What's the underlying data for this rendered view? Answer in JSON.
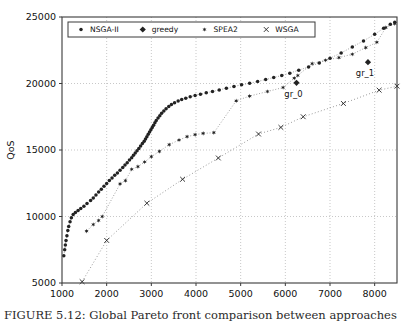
{
  "figure": {
    "caption": "FIGURE 5.12: Global Pareto front comparison between approaches",
    "background_color": "#ffffff"
  },
  "chart_data": {
    "type": "scatter",
    "title": "",
    "xlabel": "cost",
    "ylabel": "QoS",
    "xlim": [
      1000,
      8500
    ],
    "ylim": [
      5000,
      25000
    ],
    "xticks": [
      1000,
      2000,
      3000,
      4000,
      5000,
      6000,
      7000,
      8000
    ],
    "yticks": [
      5000,
      10000,
      15000,
      20000,
      25000
    ],
    "xticklabels": [
      "1000",
      "2000",
      "3000",
      "4000",
      "5000",
      "6000",
      "7000",
      "8000"
    ],
    "yticklabels": [
      "5000",
      "10000",
      "15000",
      "20000",
      "25000"
    ],
    "grid": true,
    "grid_style": "dotted",
    "grid_color": "#b0b0b0",
    "marker_color": "#222222",
    "legend_position": "upper left",
    "legend": [
      {
        "name": "NSGA-II",
        "marker": "point-marker",
        "symbol": "▪"
      },
      {
        "name": "greedy",
        "marker": "diamond-marker",
        "symbol": "♦"
      },
      {
        "name": "SPEA2",
        "marker": "star-marker",
        "symbol": "✶"
      },
      {
        "name": "WSGA",
        "marker": "cross-marker",
        "symbol": "×"
      }
    ],
    "annotations": [
      {
        "label": "gr_0",
        "x": 6250,
        "y": 20050,
        "series": "greedy"
      },
      {
        "label": "gr_1",
        "x": 7850,
        "y": 21600,
        "series": "greedy"
      }
    ],
    "series": [
      {
        "name": "NSGA-II",
        "marker": "point-marker",
        "points": [
          [
            1040,
            7050
          ],
          [
            1060,
            7500
          ],
          [
            1075,
            7850
          ],
          [
            1090,
            8200
          ],
          [
            1110,
            8550
          ],
          [
            1130,
            8950
          ],
          [
            1150,
            9250
          ],
          [
            1180,
            9600
          ],
          [
            1210,
            9900
          ],
          [
            1250,
            10150
          ],
          [
            1300,
            10300
          ],
          [
            1360,
            10450
          ],
          [
            1420,
            10600
          ],
          [
            1490,
            10780
          ],
          [
            1560,
            10980
          ],
          [
            1640,
            11200
          ],
          [
            1700,
            11400
          ],
          [
            1760,
            11620
          ],
          [
            1820,
            11850
          ],
          [
            1880,
            12050
          ],
          [
            1940,
            12280
          ],
          [
            2000,
            12480
          ],
          [
            2060,
            12700
          ],
          [
            2120,
            12900
          ],
          [
            2180,
            13100
          ],
          [
            2240,
            13280
          ],
          [
            2300,
            13480
          ],
          [
            2360,
            13680
          ],
          [
            2410,
            13880
          ],
          [
            2460,
            14050
          ],
          [
            2510,
            14250
          ],
          [
            2560,
            14420
          ],
          [
            2600,
            14600
          ],
          [
            2640,
            14780
          ],
          [
            2680,
            14950
          ],
          [
            2720,
            15120
          ],
          [
            2760,
            15300
          ],
          [
            2800,
            15480
          ],
          [
            2840,
            15650
          ],
          [
            2870,
            15820
          ],
          [
            2900,
            16000
          ],
          [
            2930,
            16180
          ],
          [
            2960,
            16350
          ],
          [
            2990,
            16520
          ],
          [
            3020,
            16700
          ],
          [
            3050,
            16870
          ],
          [
            3080,
            17050
          ],
          [
            3110,
            17220
          ],
          [
            3150,
            17400
          ],
          [
            3190,
            17580
          ],
          [
            3230,
            17760
          ],
          [
            3280,
            17940
          ],
          [
            3330,
            18100
          ],
          [
            3390,
            18280
          ],
          [
            3450,
            18420
          ],
          [
            3520,
            18560
          ],
          [
            3600,
            18680
          ],
          [
            3680,
            18800
          ],
          [
            3770,
            18900
          ],
          [
            3870,
            19000
          ],
          [
            3980,
            19100
          ],
          [
            4100,
            19200
          ],
          [
            4230,
            19300
          ],
          [
            4370,
            19400
          ],
          [
            4520,
            19520
          ],
          [
            4680,
            19650
          ],
          [
            4850,
            19780
          ],
          [
            5020,
            19900
          ],
          [
            5200,
            20020
          ],
          [
            5380,
            20150
          ],
          [
            5560,
            20300
          ],
          [
            5740,
            20450
          ],
          [
            5920,
            20600
          ],
          [
            6100,
            20780
          ],
          [
            6300,
            21000
          ],
          [
            6520,
            21250
          ],
          [
            6760,
            21550
          ],
          [
            7000,
            21900
          ],
          [
            7250,
            22300
          ],
          [
            7500,
            22750
          ],
          [
            7750,
            23200
          ],
          [
            8000,
            23700
          ],
          [
            8200,
            24150
          ],
          [
            8350,
            24450
          ],
          [
            8450,
            24600
          ]
        ]
      },
      {
        "name": "SPEA2",
        "marker": "star-marker",
        "points": [
          [
            1550,
            8900
          ],
          [
            1700,
            9400
          ],
          [
            1820,
            9700
          ],
          [
            1900,
            10000
          ],
          [
            2300,
            12450
          ],
          [
            2420,
            12700
          ],
          [
            2560,
            13550
          ],
          [
            2700,
            13750
          ],
          [
            2850,
            14100
          ],
          [
            3000,
            14500
          ],
          [
            3180,
            14900
          ],
          [
            3400,
            15400
          ],
          [
            3620,
            15750
          ],
          [
            3800,
            16000
          ],
          [
            3980,
            16150
          ],
          [
            4160,
            16250
          ],
          [
            4400,
            16300
          ],
          [
            4900,
            18700
          ],
          [
            5200,
            19050
          ],
          [
            5600,
            19400
          ],
          [
            5950,
            19700
          ],
          [
            6200,
            20400
          ],
          [
            6280,
            20600
          ],
          [
            6600,
            21500
          ],
          [
            6900,
            21750
          ],
          [
            7200,
            21950
          ],
          [
            7500,
            22200
          ],
          [
            7800,
            22700
          ],
          [
            8050,
            23100
          ],
          [
            8250,
            24200
          ],
          [
            8450,
            24500
          ]
        ]
      },
      {
        "name": "WSGA",
        "marker": "cross-marker",
        "points": [
          [
            1450,
            5100
          ],
          [
            2000,
            8200
          ],
          [
            2900,
            11000
          ],
          [
            3700,
            12800
          ],
          [
            4500,
            14400
          ],
          [
            5400,
            16200
          ],
          [
            5900,
            16700
          ],
          [
            6400,
            17500
          ],
          [
            7300,
            18500
          ],
          [
            8100,
            19500
          ],
          [
            8500,
            19800
          ]
        ]
      },
      {
        "name": "greedy",
        "marker": "diamond-marker",
        "points": [
          [
            6250,
            20050
          ],
          [
            7850,
            21600
          ]
        ]
      }
    ]
  }
}
